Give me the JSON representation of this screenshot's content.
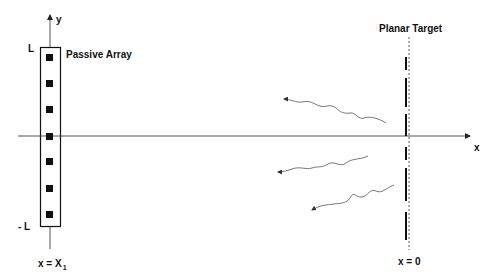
{
  "diagram": {
    "labels": {
      "y_axis": "y",
      "x_axis": "x",
      "top_limit": "L",
      "bottom_limit": "- L",
      "array_title": "Passive Array",
      "array_position_prefix": "x = X",
      "array_position_subscript": "1",
      "target_title": "Planar Target",
      "target_position": "x = 0"
    },
    "array": {
      "element_count": 7,
      "element_shape": "filled-square"
    },
    "target": {
      "segment_count": 6,
      "boundary_style": "dashed"
    },
    "waves": {
      "count": 3,
      "direction": "from target toward array"
    },
    "colors": {
      "ink": "#111111",
      "axis": "#555555",
      "wave": "#777777",
      "background": "#ffffff"
    }
  }
}
